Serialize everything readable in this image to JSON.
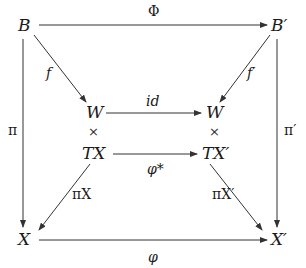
{
  "diagram": {
    "type": "commutative-diagram",
    "nodes": {
      "B": "B",
      "B_prime": "B′",
      "W_left": "W",
      "W_right": "W",
      "times_left": "×",
      "times_right": "×",
      "TX": "TX",
      "TX_prime": "TX′",
      "X": "X",
      "X_prime": "X′"
    },
    "edges": {
      "Phi": {
        "from": "B",
        "to": "B′",
        "label": "Φ"
      },
      "f": {
        "from": "B",
        "to": "W",
        "label": "f"
      },
      "f_prime": {
        "from": "B′",
        "to": "W",
        "label": "f′"
      },
      "id": {
        "from": "W",
        "to": "W",
        "label": "id"
      },
      "phi_star": {
        "from": "TX",
        "to": "TX′",
        "label": "φ*"
      },
      "pi": {
        "from": "B",
        "to": "X",
        "label": "π"
      },
      "pi_prime": {
        "from": "B′",
        "to": "X′",
        "label": "π′"
      },
      "pi_X": {
        "from": "TX",
        "to": "X",
        "label": "πX"
      },
      "pi_X_prime": {
        "from": "TX′",
        "to": "X′",
        "label": "πX′"
      },
      "phi": {
        "from": "X",
        "to": "X′",
        "label": "φ"
      }
    },
    "colors": {
      "ink": "#1a1a1a",
      "arrow": "#333333",
      "background": "#ffffff"
    }
  }
}
